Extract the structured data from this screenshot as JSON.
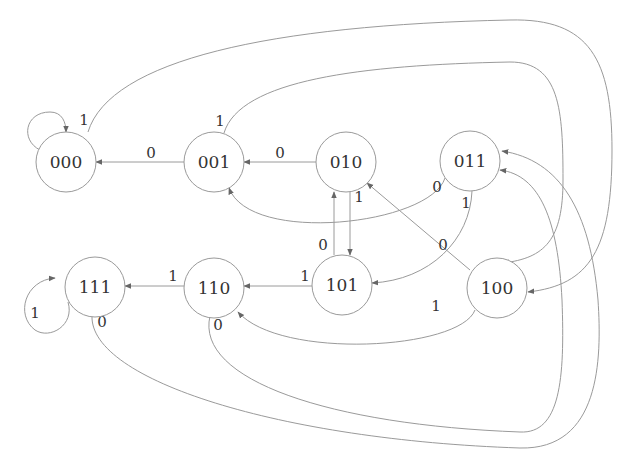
{
  "diagram": {
    "type": "state-transition-diagram",
    "states": [
      {
        "id": "000",
        "label": "000"
      },
      {
        "id": "001",
        "label": "001"
      },
      {
        "id": "010",
        "label": "010"
      },
      {
        "id": "011",
        "label": "011"
      },
      {
        "id": "100",
        "label": "100"
      },
      {
        "id": "101",
        "label": "101"
      },
      {
        "id": "110",
        "label": "110"
      },
      {
        "id": "111",
        "label": "111"
      }
    ],
    "transitions": [
      {
        "from": "000",
        "to": "000",
        "input": "0"
      },
      {
        "from": "000",
        "to": "100",
        "input": "1"
      },
      {
        "from": "001",
        "to": "000",
        "input": "0"
      },
      {
        "from": "001",
        "to": "100",
        "input": "1"
      },
      {
        "from": "010",
        "to": "001",
        "input": "0"
      },
      {
        "from": "010",
        "to": "101",
        "input": "1"
      },
      {
        "from": "011",
        "to": "001",
        "input": "0"
      },
      {
        "from": "011",
        "to": "101",
        "input": "1"
      },
      {
        "from": "100",
        "to": "010",
        "input": "0"
      },
      {
        "from": "100",
        "to": "110",
        "input": "1"
      },
      {
        "from": "101",
        "to": "010",
        "input": "0"
      },
      {
        "from": "101",
        "to": "110",
        "input": "1"
      },
      {
        "from": "110",
        "to": "011",
        "input": "0"
      },
      {
        "from": "110",
        "to": "111",
        "input": "1"
      },
      {
        "from": "111",
        "to": "011",
        "input": "0"
      },
      {
        "from": "111",
        "to": "111",
        "input": "1"
      }
    ]
  }
}
